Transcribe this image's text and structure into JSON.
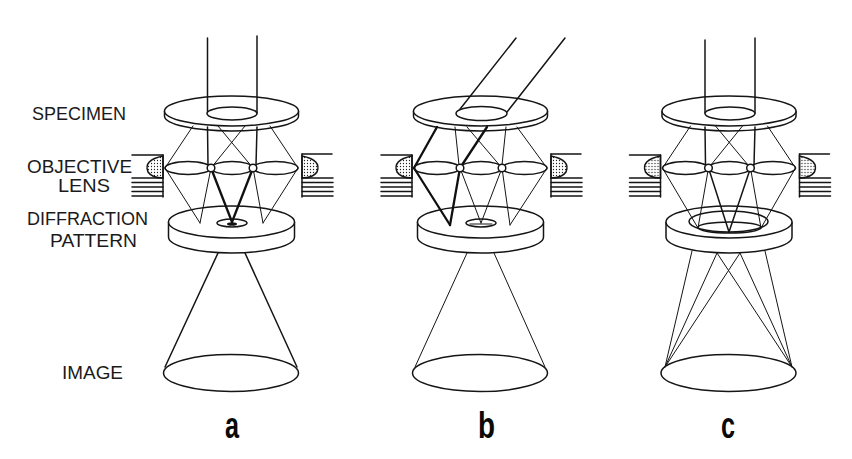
{
  "figure": {
    "left_labels": {
      "specimen": "SPECIMEN",
      "objective": "OBJECTIVE",
      "lens": "LENS",
      "diffraction": "DIFFRACTION",
      "pattern": "PATTERN",
      "image": "IMAGE"
    },
    "panels": [
      {
        "id": "a",
        "label": "a",
        "illumination": "axial beam, central aperture"
      },
      {
        "id": "b",
        "label": "b",
        "illumination": "tilted beam, central aperture"
      },
      {
        "id": "c",
        "label": "c",
        "illumination": "axial beam, annular aperture"
      }
    ],
    "colors": {
      "ink": "#151515",
      "background": "#ffffff"
    }
  }
}
